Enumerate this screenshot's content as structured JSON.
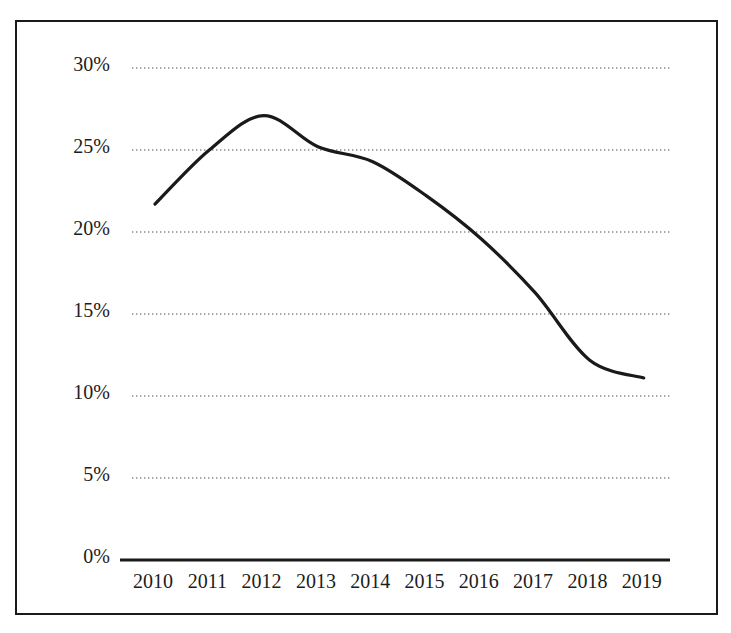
{
  "chart_data": {
    "type": "line",
    "title": "",
    "subtitle": "",
    "xlabel": "",
    "ylabel": "",
    "categories": [
      "2010",
      "2011",
      "2012",
      "2013",
      "2014",
      "2015",
      "2016",
      "2017",
      "2018",
      "2019"
    ],
    "x": [
      2010,
      2011,
      2012,
      2013,
      2014,
      2015,
      2016,
      2017,
      2018,
      2019
    ],
    "series": [
      {
        "name": "",
        "values": [
          21.7,
          25.0,
          27.1,
          25.2,
          24.3,
          22.2,
          19.6,
          16.3,
          12.2,
          11.1
        ]
      }
    ],
    "values": [
      21.7,
      25.0,
      27.1,
      25.2,
      24.3,
      22.2,
      19.6,
      16.3,
      12.2,
      11.1
    ],
    "ylim": [
      0,
      30
    ],
    "ytick_values": [
      0,
      5,
      10,
      15,
      20,
      25,
      30
    ],
    "ytick_labels": [
      "0%",
      "5%",
      "10%",
      "15%",
      "20%",
      "25%",
      "30%"
    ],
    "xtick_labels": [
      "2010",
      "2011",
      "2012",
      "2013",
      "2014",
      "2015",
      "2016",
      "2017",
      "2018",
      "2019"
    ],
    "grid": "horizontal-dotted",
    "legend": "none",
    "line_color": "#1a1a1a",
    "axis_color": "#1a1a1a",
    "grid_color": "#8a8a8a",
    "border_color": "#1a1a1a",
    "background_color": "#ffffff",
    "annotations": []
  }
}
